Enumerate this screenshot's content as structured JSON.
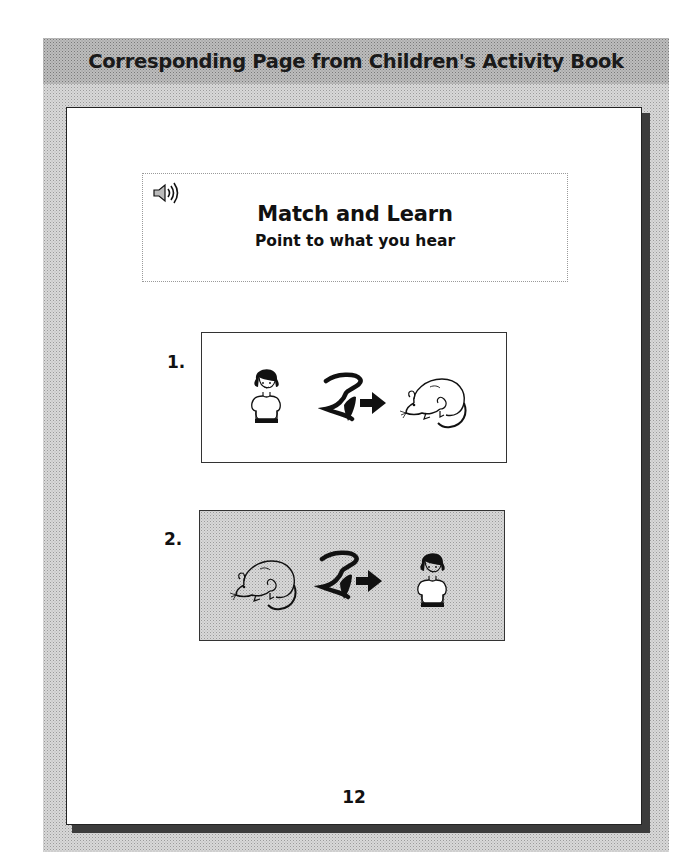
{
  "panel": {
    "title": "Corresponding Page from Children's Activity Book"
  },
  "page": {
    "header": {
      "icon": "speaker-sound-icon",
      "title": "Match and Learn",
      "subtitle": "Point to what you hear"
    },
    "items": [
      {
        "number": "1.",
        "background": "white",
        "symbols": [
          "girl-icon",
          "see-sign-arrow-icon",
          "mouse-icon"
        ]
      },
      {
        "number": "2.",
        "background": "shaded",
        "symbols": [
          "mouse-icon",
          "see-sign-arrow-icon",
          "girl-icon"
        ]
      }
    ],
    "page_number": "12"
  },
  "colors": {
    "panel_gray": "#d8d8d8",
    "title_band_gray": "#bdbdbd",
    "page_white": "#ffffff",
    "shadow": "#3c3c3c",
    "text": "#111111"
  }
}
